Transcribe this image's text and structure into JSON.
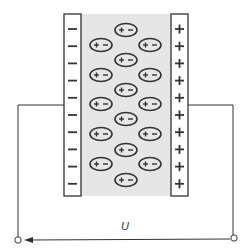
{
  "diagram": {
    "voltage_label": "U",
    "left_plate": {
      "charge_symbol": "−",
      "count": 10
    },
    "right_plate": {
      "charge_symbol": "+",
      "count": 10
    },
    "dipole": {
      "plus": "+",
      "minus": "−"
    },
    "colors": {
      "stroke": "#333333",
      "dielectric_fill": "#e6e6e6",
      "plate_fill": "#ffffff",
      "background": "#ffffff"
    }
  }
}
